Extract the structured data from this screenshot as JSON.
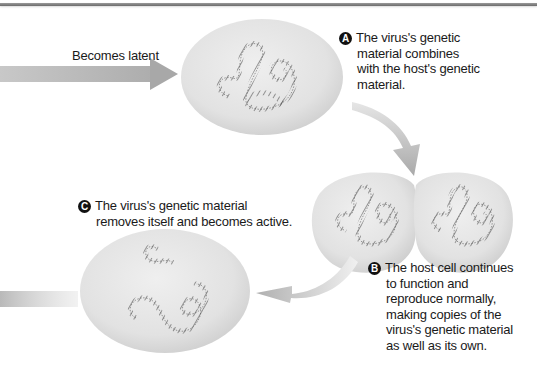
{
  "diagram": {
    "type": "lysogenic-cycle-excerpt",
    "colors": {
      "cell_fill": "#e6e6e6",
      "cell_shade": "#c9c9c9",
      "arrow": "#b5b5b5",
      "dna": "#555555",
      "text": "#1a1a1a",
      "badge": "#111111"
    },
    "arrow_label": "Becomes latent",
    "steps": [
      {
        "badge": "A",
        "lines": [
          "The virus's genetic",
          "material combines",
          "with the host's genetic",
          "material."
        ]
      },
      {
        "badge": "B",
        "lines": [
          "The host cell continues",
          "to function and",
          "reproduce normally,",
          "making copies of the",
          "virus's genetic material",
          "as well as its own."
        ]
      },
      {
        "badge": "C",
        "lines": [
          "The virus's genetic material",
          "removes itself and becomes active."
        ]
      }
    ],
    "cells": [
      {
        "name": "latent-host-cell",
        "content": "combined genetic material"
      },
      {
        "name": "dividing-host-cell-left",
        "content": "copied genetic material"
      },
      {
        "name": "dividing-host-cell-right",
        "content": "copied genetic material"
      },
      {
        "name": "activated-host-cell",
        "content": "separated viral genetic material"
      }
    ]
  }
}
